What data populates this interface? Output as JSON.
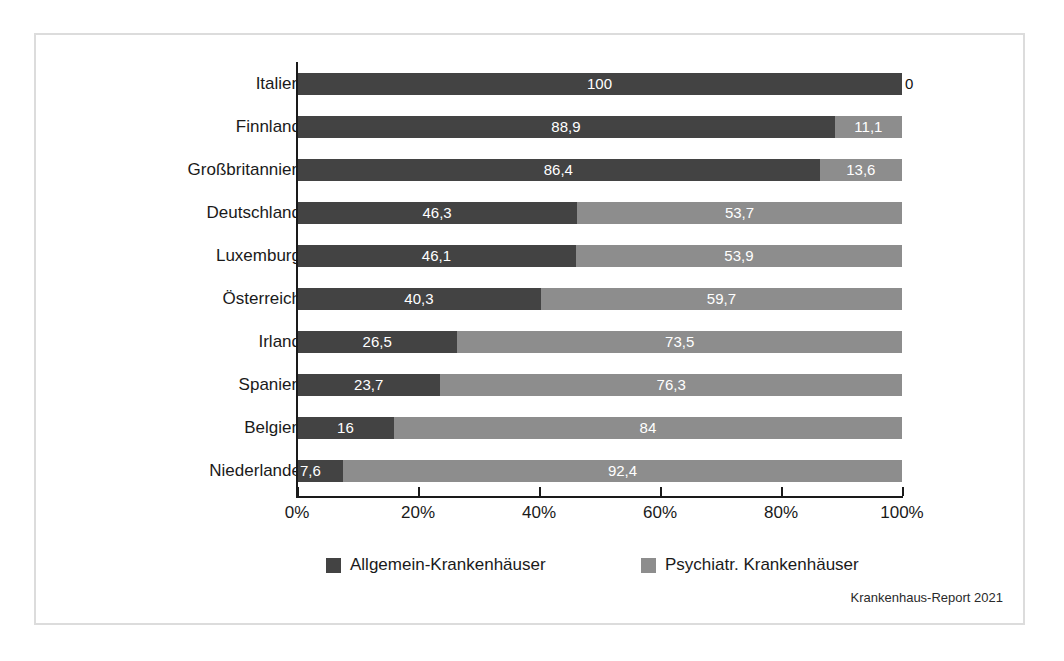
{
  "source_note": "Krankenhaus-Report 2021",
  "legend": {
    "items": [
      {
        "label": "Allgemein-Krankenhäuser",
        "color": "#434343",
        "key": "allgemein"
      },
      {
        "label": "Psychiatr. Krankenhäuser",
        "color": "#8d8d8d",
        "key": "psychiatr"
      }
    ]
  },
  "axis": {
    "ticks": [
      "0%",
      "20%",
      "40%",
      "60%",
      "80%",
      "100%"
    ],
    "tick_values": [
      0,
      20,
      40,
      60,
      80,
      100
    ]
  },
  "chart_data": {
    "type": "bar",
    "orientation": "horizontal",
    "stacked": true,
    "normalized_percent": true,
    "title": "",
    "xlabel": "",
    "ylabel": "",
    "xlim": [
      0,
      100
    ],
    "grid": false,
    "legend_position": "bottom",
    "categories": [
      "Italien",
      "Finnland",
      "Großbritannien",
      "Deutschland",
      "Luxemburg",
      "Österreich",
      "Irland",
      "Spanien",
      "Belgien",
      "Niederlande"
    ],
    "series": [
      {
        "name": "Allgemein-Krankenhäuser",
        "color": "#434343",
        "values": [
          100,
          88.9,
          86.4,
          46.3,
          46.1,
          40.3,
          26.5,
          23.7,
          16,
          7.6
        ]
      },
      {
        "name": "Psychiatr. Krankenhäuser",
        "color": "#8d8d8d",
        "values": [
          0,
          11.1,
          13.6,
          53.7,
          53.9,
          59.7,
          73.5,
          76.3,
          84,
          92.4
        ]
      }
    ],
    "rows": [
      {
        "category": "Italien",
        "dark_value": 100,
        "dark_label": "100",
        "light_value": 0,
        "light_label": "0",
        "light_label_outside": true
      },
      {
        "category": "Finnland",
        "dark_value": 88.9,
        "dark_label": "88,9",
        "light_value": 11.1,
        "light_label": "11,1",
        "light_label_outside": false
      },
      {
        "category": "Großbritannien",
        "dark_value": 86.4,
        "dark_label": "86,4",
        "light_value": 13.6,
        "light_label": "13,6",
        "light_label_outside": false
      },
      {
        "category": "Deutschland",
        "dark_value": 46.3,
        "dark_label": "46,3",
        "light_value": 53.7,
        "light_label": "53,7",
        "light_label_outside": false
      },
      {
        "category": "Luxemburg",
        "dark_value": 46.1,
        "dark_label": "46,1",
        "light_value": 53.9,
        "light_label": "53,9",
        "light_label_outside": false
      },
      {
        "category": "Österreich",
        "dark_value": 40.3,
        "dark_label": "40,3",
        "light_value": 59.7,
        "light_label": "59,7",
        "light_label_outside": false
      },
      {
        "category": "Irland",
        "dark_value": 26.5,
        "dark_label": "26,5",
        "light_value": 73.5,
        "light_label": "73,5",
        "light_label_outside": false
      },
      {
        "category": "Spanien",
        "dark_value": 23.7,
        "dark_label": "23,7",
        "light_value": 76.3,
        "light_label": "76,3",
        "light_label_outside": false
      },
      {
        "category": "Belgien",
        "dark_value": 16,
        "dark_label": "16",
        "light_value": 84,
        "light_label": "84",
        "light_label_outside": false
      },
      {
        "category": "Niederlande",
        "dark_value": 7.6,
        "dark_label": "7,6",
        "light_value": 92.4,
        "light_label": "92,4",
        "light_label_outside": false
      }
    ]
  }
}
